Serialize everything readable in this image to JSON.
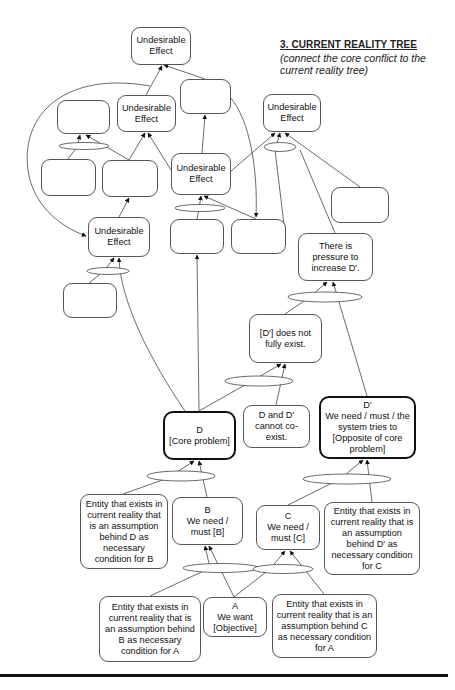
{
  "title": {
    "heading": "3. CURRENT REALITY TREE",
    "subtitle": "(connect the core conflict to the current reality tree)"
  },
  "nodes": {
    "ue_top": {
      "label": "Undesirable\nEffect"
    },
    "empty_top_right": {
      "label": ""
    },
    "ue_mid_left": {
      "label": "Undesirable\nEffect"
    },
    "empty_top_left": {
      "label": ""
    },
    "ue_right": {
      "label": "Undesirable\nEffect"
    },
    "empty_row2_a": {
      "label": ""
    },
    "empty_row2_b": {
      "label": ""
    },
    "ue_center": {
      "label": "Undesirable\nEffect"
    },
    "ue_lower_left": {
      "label": "Undesirable\nEffect"
    },
    "empty_left_low": {
      "label": ""
    },
    "empty_center_a": {
      "label": ""
    },
    "empty_center_b": {
      "label": ""
    },
    "empty_right": {
      "label": ""
    },
    "pressure": {
      "label": "There is\npressure to\nincrease D'."
    },
    "d_prime_not_exist": {
      "label": "[D'] does not\nfully exist."
    },
    "d_core": {
      "label": "D\n[Core problem]"
    },
    "d_and_dprime": {
      "label": "D and D'\ncannot co-\nexist."
    },
    "d_prime": {
      "label": "D'\nWe need / must / the\nsystem tries to\n[Opposite of core\nproblem]"
    },
    "entity_b": {
      "label": "Entity that exists in\ncurrent reality that\nis an assumption\nbehind D as\nnecessary\ncondition for B"
    },
    "b_need": {
      "label": "B\nWe need /\nmust [B]"
    },
    "c_need": {
      "label": "C\nWe need /\nmust [C]"
    },
    "entity_c_dprime": {
      "label": "Entity that exists in\ncurrent reality that is\nan assumption\nbehind D' as\nnecessary condition\nfor C"
    },
    "entity_a_b": {
      "label": "Entity that exists in\ncurrent reality that is\nan assumption behind\nB as necessary\ncondition for A"
    },
    "a_want": {
      "label": "A\nWe want\n[Objective]"
    },
    "entity_a_c": {
      "label": "Entity that exists in\ncurrent reality that is an\nassumption behind C\nas necessary condition\nfor A"
    }
  },
  "colors": {
    "line": "#444444",
    "border": "#555555",
    "bold_border": "#111111",
    "background": "#ffffff"
  }
}
